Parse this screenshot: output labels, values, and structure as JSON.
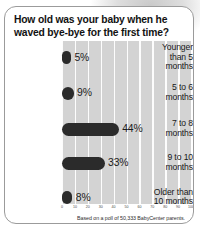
{
  "card": {
    "title": "How old was your baby when he waved bye-bye for the first time?",
    "footnote": "Based on a poll of 50,333 BabyCenter parents."
  },
  "chart_data": {
    "type": "bar",
    "orientation": "horizontal",
    "title": "How old was your baby when he waved bye-bye for the first time?",
    "xlabel": "",
    "ylabel": "",
    "xlim": [
      0,
      100
    ],
    "grid": true,
    "legend": false,
    "annotation": "Based on a poll of 50,333 BabyCenter parents.",
    "categories": [
      "Younger than 5 months",
      "5 to 6 months",
      "7 to 8 months",
      "9 to 10 months",
      "Older than 10 months"
    ],
    "category_lines": [
      [
        "Younger",
        "than 5",
        "months"
      ],
      [
        "5 to 6",
        "months"
      ],
      [
        "7 to 8",
        "months"
      ],
      [
        "9 to 10",
        "months"
      ],
      [
        "Older than",
        "10 months"
      ]
    ],
    "values": [
      5,
      9,
      44,
      33,
      8
    ],
    "value_labels": [
      "5%",
      "9%",
      "44%",
      "33%",
      "8%"
    ],
    "xticks": [
      0,
      10,
      20,
      30,
      40,
      50,
      60,
      70,
      80,
      90,
      100
    ],
    "xtick_labels": [
      "0",
      "10",
      "20",
      "30",
      "40",
      "50",
      "60",
      "70",
      "80",
      "90",
      "100"
    ],
    "bar_color": "#2b2b2b",
    "plot_background": "#d3d3d3",
    "gridline_color": "#ffffff"
  }
}
